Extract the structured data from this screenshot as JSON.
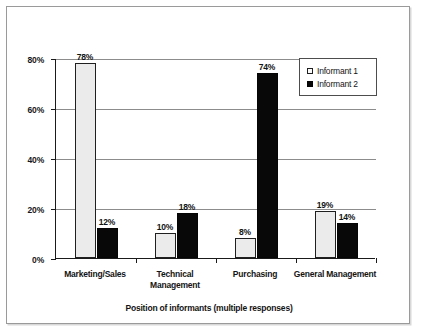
{
  "chart_data": {
    "type": "bar",
    "title": "",
    "xlabel": "Position of informants (multiple responses)",
    "ylabel": "",
    "categories": [
      "Marketing/Sales",
      "Technical Management",
      "Purchasing",
      "General Management"
    ],
    "series": [
      {
        "name": "Informant 1",
        "values": [
          78,
          10,
          8,
          19
        ],
        "value_labels": [
          "78%",
          "10%",
          "8%",
          "19%"
        ],
        "color": "#ebebeb",
        "edge_color": "#1f1f1f"
      },
      {
        "name": "Informant 2",
        "values": [
          12,
          18,
          74,
          14
        ],
        "value_labels": [
          "12%",
          "18%",
          "74%",
          "14%"
        ],
        "color": "#080808",
        "edge_color": "#050505"
      }
    ],
    "ylim": [
      0,
      80
    ],
    "yticks": [
      0,
      20,
      40,
      60,
      80
    ],
    "ytick_labels": [
      "0%",
      "20%",
      "40%",
      "60%",
      "80%"
    ],
    "grid": true,
    "grid_axis": "y",
    "legend_position": "upper right",
    "value_unit": "%"
  },
  "legend": {
    "entries": [
      {
        "label": "Informant 1",
        "swatch": "open-square-swatch"
      },
      {
        "label": "Informant 2",
        "swatch": "filled-square-swatch"
      }
    ]
  },
  "axis": {
    "x_title": "Position of informants (multiple responses)"
  }
}
